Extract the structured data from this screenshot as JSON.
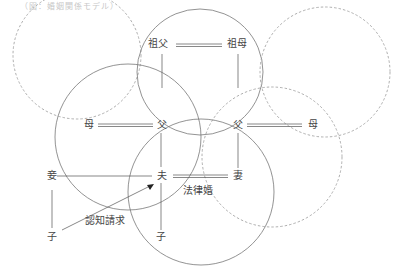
{
  "header": {
    "caption": "（図：婚姻関係モデル）"
  },
  "nodes": {
    "sofu": "祖父",
    "sobo": "祖母",
    "left_mother": "母",
    "left_father": "父",
    "right_father": "父",
    "right_mother": "母",
    "concubine": "妾",
    "husband": "夫",
    "wife": "妻",
    "child_left": "子",
    "child_center": "子"
  },
  "edge_labels": {
    "legal_marriage": "法律婚",
    "acknowledgment_claim": "認知請求"
  },
  "colors": {
    "line": "#555555",
    "solid_circle": "#777777",
    "dashed_circle": "#999999",
    "text": "#444444"
  },
  "circles": [
    {
      "name": "top-left-family",
      "cx": 77,
      "cy": 55,
      "r": 64,
      "style": "dashed"
    },
    {
      "name": "grandparents-family",
      "cx": 200,
      "cy": 72,
      "r": 63,
      "style": "solid"
    },
    {
      "name": "top-right-family",
      "cx": 325,
      "cy": 72,
      "r": 65,
      "style": "dashed"
    },
    {
      "name": "husband-parents-family",
      "cx": 128,
      "cy": 137,
      "r": 73,
      "style": "solid"
    },
    {
      "name": "wife-parents-family",
      "cx": 272,
      "cy": 157,
      "r": 70,
      "style": "dashed"
    },
    {
      "name": "couple-family",
      "cx": 201,
      "cy": 192,
      "r": 73,
      "style": "solid"
    }
  ]
}
